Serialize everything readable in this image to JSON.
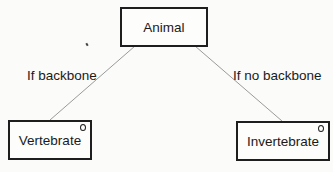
{
  "diagram": {
    "type": "tree",
    "root": {
      "label": "Animal"
    },
    "children": [
      {
        "label": "Vertebrate",
        "edge_label": "If backbone",
        "marker": "circle"
      },
      {
        "label": "Invertebrate",
        "edge_label": "If no backbone",
        "marker": "circle"
      }
    ]
  },
  "colors": {
    "line": "#9a9a9a",
    "border": "#1e1e1e",
    "background": "#fbfbf9"
  }
}
